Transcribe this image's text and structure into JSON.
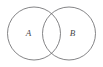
{
  "figure": {
    "name": "venn-diagram",
    "type": "venn-two-set",
    "background_color": "#ffffff",
    "stroke_color": "#6e6e70",
    "label_color": "#4a4a4c",
    "width": 103,
    "height": 67
  },
  "sets": [
    {
      "id": "set-a",
      "label": "A",
      "cx": 34,
      "cy": 33.5,
      "r": 26.5,
      "label_x": 28.5,
      "label_y": 33.5
    },
    {
      "id": "set-b",
      "label": "B",
      "cx": 69,
      "cy": 33.5,
      "r": 26.5,
      "label_x": 72.5,
      "label_y": 33.5
    }
  ]
}
